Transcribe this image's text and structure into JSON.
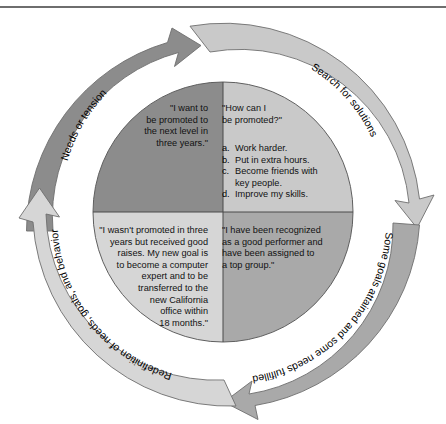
{
  "figure": {
    "type": "cycle-diagram",
    "segments": 4
  },
  "colors": {
    "quadrant_top_left": "#8c8c8c",
    "quadrant_top_right": "#c9c9c9",
    "quadrant_bottom_left": "#d6d6d6",
    "quadrant_bottom_right": "#a9a9a9",
    "arrow_dark": "#8c8c8c",
    "arrow_light": "#c9c9c9",
    "arrow_lightest": "#d6d6d6",
    "arrow_mid": "#a9a9a9",
    "outline": "#6e6e6e",
    "text": "#111111",
    "background": "#ffffff"
  },
  "arrows": [
    {
      "id": "needs-or-tension",
      "label": "Needs or tension",
      "tone": "dark"
    },
    {
      "id": "search-for-solutions",
      "label": "Search for solutions",
      "tone": "light"
    },
    {
      "id": "goals-attained",
      "label": "Some goals attained and some needs fulfilled",
      "tone": "mid"
    },
    {
      "id": "redefinition",
      "label": "Redefinition of needs, goals, and behavior",
      "tone": "lightest"
    }
  ],
  "quadrants": {
    "top_left": {
      "id": "needs-quadrant",
      "text": "\"I want to\nbe promoted to\nthe next level in\nthree years.\""
    },
    "top_right": {
      "id": "solutions-quadrant",
      "heading": "\"How can I\nbe promoted?\"",
      "options": [
        {
          "key": "a.",
          "text": "Work harder."
        },
        {
          "key": "b.",
          "text": "Put in extra hours."
        },
        {
          "key": "c.",
          "text": "Become friends with\nkey people."
        },
        {
          "key": "d.",
          "text": "Improve my skills."
        }
      ]
    },
    "bottom_right": {
      "id": "attainment-quadrant",
      "text": "\"I have been recognized\nas a good performer and\nhave been assigned to\na top group.\""
    },
    "bottom_left": {
      "id": "redefinition-quadrant",
      "text": "\"I wasn't promoted in three\nyears but received good\nraises.  My new goal is\nto become a computer\nexpert and to be\ntransferred to the\nnew California\noffice within\n18 months.\""
    }
  }
}
